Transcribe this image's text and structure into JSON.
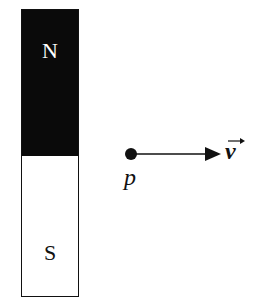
{
  "magnet": {
    "north_label": "N",
    "south_label": "S",
    "north_color": "#0a0a0a",
    "south_color": "#ffffff"
  },
  "particle": {
    "label": "p"
  },
  "velocity": {
    "label": "v",
    "vector_arrow": "→"
  }
}
